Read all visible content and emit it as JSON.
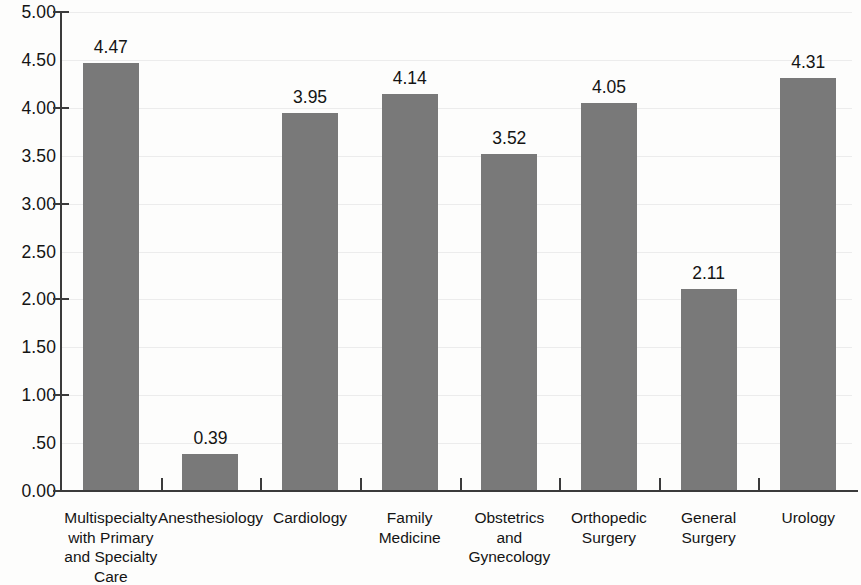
{
  "chart_data": {
    "type": "bar",
    "title": "",
    "subtitle": "",
    "xlabel": "",
    "ylabel": "",
    "ylim": [
      0.0,
      5.0
    ],
    "grid": true,
    "legend": "none",
    "bar_color": "#797979",
    "axis_color": "#3b3b3b",
    "categories": [
      "Multispecialty with Primary and Specialty Care",
      "Anesthesiology",
      "Cardiology",
      "Family Medicine",
      "Obstetrics and Gynecology",
      "Orthopedic Surgery",
      "General Surgery",
      "Urology"
    ],
    "category_lines": [
      [
        "Multispecialty",
        "with Primary",
        "and Specialty",
        "Care"
      ],
      [
        "Anesthesiology"
      ],
      [
        "Cardiology"
      ],
      [
        "Family",
        "Medicine"
      ],
      [
        "Obstetrics",
        "and",
        "Gynecology"
      ],
      [
        "Orthopedic",
        "Surgery"
      ],
      [
        "General",
        "Surgery"
      ],
      [
        "Urology"
      ]
    ],
    "values": [
      4.47,
      0.39,
      3.95,
      4.14,
      3.52,
      4.05,
      2.11,
      4.31
    ],
    "value_labels": [
      "4.47",
      "0.39",
      "3.95",
      "4.14",
      "3.52",
      "4.05",
      "2.11",
      "4.31"
    ],
    "y_ticks": [
      {
        "value": 5.0,
        "label": "5.00",
        "major": true
      },
      {
        "value": 4.5,
        "label": "4.50",
        "major": false
      },
      {
        "value": 4.0,
        "label": "4.00",
        "major": true
      },
      {
        "value": 3.5,
        "label": "3.50",
        "major": false
      },
      {
        "value": 3.0,
        "label": "3.00",
        "major": true
      },
      {
        "value": 2.5,
        "label": "2.50",
        "major": false
      },
      {
        "value": 2.0,
        "label": "2.00",
        "major": true
      },
      {
        "value": 1.5,
        "label": "1.50",
        "major": false
      },
      {
        "value": 1.0,
        "label": "1.00",
        "major": true
      },
      {
        "value": 0.5,
        "label": ".50",
        "major": false
      },
      {
        "value": 0.0,
        "label": "0.00",
        "major": true
      }
    ]
  }
}
